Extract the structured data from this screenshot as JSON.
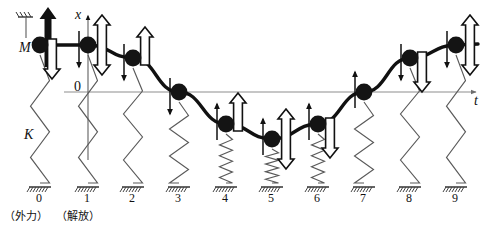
{
  "figure": {
    "kind": "physics-diagram",
    "axes": {
      "x_axis_label": "x",
      "t_axis_label": "t",
      "origin_label": "0",
      "x_axis_meaning": "displacement",
      "t_axis_meaning": "time"
    },
    "labels": {
      "mass_label": "M",
      "spring_label": "K"
    },
    "annotations": [
      {
        "id": "ann-external-force",
        "text": "（外力）",
        "under_tick": "0"
      },
      {
        "id": "ann-release",
        "text": "（解放）",
        "under_tick": "1"
      }
    ],
    "tick_labels": [
      "0",
      "1",
      "2",
      "3",
      "4",
      "5",
      "6",
      "7",
      "8",
      "9"
    ],
    "colors": {
      "ink": "#111111",
      "curve": "#111111",
      "spring": "#5a5a5a",
      "axis": "#8a8a8a",
      "mass_fill": "#141414",
      "arrow_solid": "#111111",
      "arrow_hollow_fill": "#ffffff",
      "arrow_hollow_stroke": "#111111",
      "background": "#ffffff"
    },
    "icons": {
      "force_arrow": "solid-up-arrow-icon",
      "displacement_arrow": "hollow-double-arrow-icon",
      "velocity_arrow": "thin-arrow-icon",
      "mass": "filled-circle-icon",
      "ground": "hatched-ground-icon",
      "ceiling": "hatched-ceiling-icon",
      "spring": "zigzag-spring-icon",
      "guide": "dashed-guide-line-icon"
    }
  },
  "chart_data": {
    "type": "line",
    "title": "",
    "xlabel": "t",
    "ylabel": "x",
    "grid": false,
    "legend": "none",
    "x": [
      0,
      1,
      2,
      3,
      4,
      5,
      6,
      7,
      8,
      9
    ],
    "categories": [
      "0",
      "1",
      "2",
      "3",
      "4",
      "5",
      "6",
      "7",
      "8",
      "9"
    ],
    "values": [
      1.0,
      1.0,
      0.71,
      0.0,
      -0.71,
      -1.0,
      -0.71,
      0.0,
      0.71,
      1.0
    ],
    "series": [
      {
        "name": "displacement x(t)",
        "values": [
          1.0,
          1.0,
          0.71,
          0.0,
          -0.71,
          -1.0,
          -0.71,
          0.0,
          0.71,
          1.0
        ]
      }
    ],
    "xlim": [
      0,
      9.6
    ],
    "ylim": [
      -1.25,
      1.25
    ]
  },
  "states": [
    {
      "tick": "0",
      "x_px": 40,
      "y_px": 45,
      "level": 1.0,
      "spring": "stretched",
      "arrow_force": "up-solid",
      "arrow_disp": "down-hollow",
      "arrow_vel": "none",
      "has_ceiling": true
    },
    {
      "tick": "1",
      "x_px": 88,
      "y_px": 45,
      "level": 1.0,
      "spring": "stretched",
      "arrow_force": "none",
      "arrow_disp": "double-hollow",
      "arrow_vel": "down-thin",
      "has_ceiling": false
    },
    {
      "tick": "2",
      "x_px": 133,
      "y_px": 58,
      "level": 0.71,
      "spring": "stretched",
      "arrow_force": "none",
      "arrow_disp": "up-hollow",
      "arrow_vel": "down-thin",
      "has_ceiling": false
    },
    {
      "tick": "3",
      "x_px": 179,
      "y_px": 92,
      "level": 0.0,
      "spring": "natural",
      "arrow_force": "none",
      "arrow_disp": "none",
      "arrow_vel": "down-thin",
      "has_ceiling": false
    },
    {
      "tick": "4",
      "x_px": 226,
      "y_px": 124,
      "level": -0.71,
      "spring": "compressed",
      "arrow_force": "none",
      "arrow_disp": "up-hollow",
      "arrow_vel": "up-thin",
      "has_ceiling": false
    },
    {
      "tick": "5",
      "x_px": 272,
      "y_px": 139,
      "level": -1.0,
      "spring": "compressed",
      "arrow_force": "none",
      "arrow_disp": "double-hollow",
      "arrow_vel": "up-thin",
      "has_ceiling": false
    },
    {
      "tick": "6",
      "x_px": 318,
      "y_px": 124,
      "level": -0.71,
      "spring": "compressed",
      "arrow_force": "none",
      "arrow_disp": "down-hollow",
      "arrow_vel": "up-thin",
      "has_ceiling": false
    },
    {
      "tick": "7",
      "x_px": 364,
      "y_px": 92,
      "level": 0.0,
      "spring": "natural",
      "arrow_force": "none",
      "arrow_disp": "none",
      "arrow_vel": "up-thin",
      "has_ceiling": false
    },
    {
      "tick": "8",
      "x_px": 410,
      "y_px": 58,
      "level": 0.71,
      "spring": "stretched",
      "arrow_force": "none",
      "arrow_disp": "down-hollow",
      "arrow_vel": "down-thin",
      "has_ceiling": false
    },
    {
      "tick": "9",
      "x_px": 456,
      "y_px": 45,
      "level": 1.0,
      "spring": "stretched",
      "arrow_force": "none",
      "arrow_disp": "double-hollow",
      "arrow_vel": "down-thin",
      "has_ceiling": false
    }
  ]
}
